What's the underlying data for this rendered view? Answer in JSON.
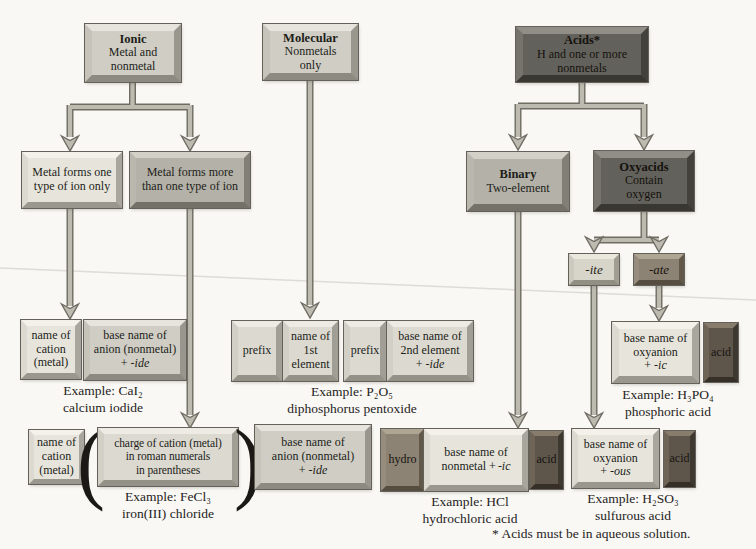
{
  "palette": {
    "background": "#f9f8f4",
    "box_light": "#e7e4dc",
    "box_medium": "#d0cdc5",
    "box_gray": "#b4b1a9",
    "box_dark": "#63615b",
    "box_bronze": "#8d8374",
    "acid_tab": "#5e564b",
    "arrow_fill": "#bdbab0",
    "arrow_outline": "#6e6c63",
    "text": "#211e18"
  },
  "boxes": {
    "ionic": {
      "title": "Ionic",
      "body": "Metal and\nnonmetal"
    },
    "molecular": {
      "title": "Molecular",
      "body": "Nonmetals\nonly"
    },
    "acids": {
      "title": "Acids*",
      "body": "H and one or more\nnonmetals"
    },
    "metal_one": {
      "body": "Metal forms one\ntype of ion only"
    },
    "metal_more": {
      "body": "Metal forms more\nthan one type of ion"
    },
    "binary": {
      "title": "Binary",
      "body": "Two-element"
    },
    "oxyacids": {
      "title": "Oxyacids",
      "body": "Contain\noxygen"
    },
    "ite": {
      "label": "-ite"
    },
    "ate": {
      "label": "-ate"
    },
    "cation1": {
      "body": "name of\ncation\n(metal)"
    },
    "anion1": {
      "body": "base name of\nanion (nonmetal)",
      "plus": "+ ",
      "suffix": "-ide"
    },
    "prefix1": {
      "body": "prefix"
    },
    "elem1": {
      "body": "name of\n1st\nelement"
    },
    "prefix2": {
      "body": "prefix"
    },
    "elem2": {
      "body": "base name of\n2nd element",
      "plus": "+ ",
      "suffix": "-ide"
    },
    "oxy_ic": {
      "body": "base name of\noxyanion",
      "plus": "+ ",
      "suffix": "-ic"
    },
    "acid_ic": {
      "body": "acid"
    },
    "cation2": {
      "body": "name of\ncation\n(metal)"
    },
    "charge": {
      "body": "charge of cation (metal)\nin roman numerals\nin parentheses"
    },
    "anion2": {
      "body": "base name of\nanion (nonmetal)",
      "plus": "+ ",
      "suffix": "-ide"
    },
    "hydro": {
      "body": "hydro"
    },
    "nonmetal_ic": {
      "body": "base name of\nnonmetal +",
      "suffix": "-ic"
    },
    "acid_hcl": {
      "body": "acid"
    },
    "oxy_ous": {
      "body": "base name of\noxyanion",
      "plus": "+ ",
      "suffix": "-ous"
    },
    "acid_ous": {
      "body": "acid"
    }
  },
  "parens": {
    "open": "(",
    "close": ")"
  },
  "examples": {
    "cal2": {
      "line1": "Example: CaI₂",
      "line2": "calcium iodide"
    },
    "p2o5": {
      "line1": "Example: P₂O₅",
      "line2": "diphosphorus pentoxide"
    },
    "h3po4": {
      "line1": "Example: H₃PO₄",
      "line2": "phosphoric acid"
    },
    "fecl3": {
      "line1": "Example: FeCl₃",
      "line2": "iron(III) chloride"
    },
    "hcl": {
      "line1": "Example: HCl",
      "line2": "hydrochloric acid"
    },
    "h2so3": {
      "line1": "Example: H₂SO₃",
      "line2": "sulfurous acid"
    }
  },
  "footnote": "* Acids must be in aqueous solution."
}
